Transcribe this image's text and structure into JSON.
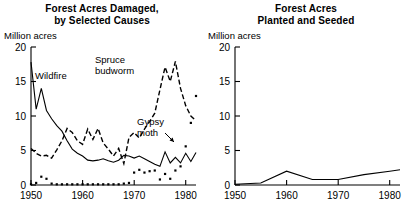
{
  "figure": {
    "unit_label_left": "Million acres",
    "unit_label_right": "Million acres"
  },
  "left": {
    "title_line1": "Forest Acres Damaged,",
    "title_line2": "by Selected Causes",
    "labels": {
      "wildfire": "Wildfire",
      "spruce_line1": "Spruce",
      "spruce_line2": "budworm",
      "gypsy_line1": "Gypsy",
      "gypsy_line2": "moth"
    },
    "y_ticks": [
      "0",
      "5",
      "10",
      "15",
      "20"
    ],
    "x_ticks": [
      "1950",
      "1960",
      "1970",
      "1980"
    ]
  },
  "right": {
    "title_line1": "Forest Acres",
    "title_line2": "Planted and Seeded",
    "y_ticks": [
      "0",
      "5",
      "10",
      "15",
      "20"
    ],
    "x_ticks": [
      "1950",
      "1960",
      "1970",
      "1980"
    ]
  },
  "chart_data": [
    {
      "type": "line",
      "title": "Forest Acres Damaged, by Selected Causes",
      "xlabel": "",
      "ylabel": "Million acres",
      "xlim": [
        1950,
        1982
      ],
      "ylim": [
        0,
        20
      ],
      "y_ticks": [
        0,
        5,
        10,
        15,
        20
      ],
      "x_ticks": [
        1950,
        1960,
        1970,
        1980
      ],
      "grid": false,
      "legend": "inline-annotations",
      "x": [
        1950,
        1951,
        1952,
        1953,
        1954,
        1955,
        1956,
        1957,
        1958,
        1959,
        1960,
        1961,
        1962,
        1963,
        1964,
        1965,
        1966,
        1967,
        1968,
        1969,
        1970,
        1971,
        1972,
        1973,
        1974,
        1975,
        1976,
        1977,
        1978,
        1979,
        1980,
        1981,
        1982
      ],
      "series": [
        {
          "name": "Wildfire",
          "style": "solid",
          "values": [
            17.8,
            11.0,
            14.0,
            10.8,
            9.6,
            8.6,
            7.8,
            6.4,
            5.2,
            4.6,
            4.2,
            3.6,
            3.5,
            3.6,
            3.8,
            3.5,
            3.3,
            3.6,
            4.3,
            4.2,
            3.9,
            4.2,
            3.8,
            3.4,
            3.0,
            2.7,
            4.8,
            3.2,
            4.0,
            3.2,
            4.6,
            3.4,
            4.7
          ]
        },
        {
          "name": "Spruce budworm",
          "style": "dashed",
          "values": [
            5.3,
            4.6,
            4.2,
            4.3,
            3.9,
            5.1,
            6.4,
            8.2,
            7.6,
            6.4,
            5.9,
            8.1,
            6.6,
            8.2,
            6.1,
            5.2,
            4.2,
            5.3,
            3.1,
            6.9,
            7.6,
            6.8,
            8.1,
            9.2,
            10.4,
            13.8,
            17.1,
            15.0,
            17.9,
            14.0,
            11.5,
            10.0,
            9.3
          ]
        },
        {
          "name": "Gypsy moth",
          "style": "dotted",
          "values": [
            0.1,
            0.3,
            1.2,
            0.9,
            0.2,
            0.1,
            0.1,
            0.1,
            0.1,
            0.1,
            0.1,
            0.1,
            0.1,
            0.1,
            0.1,
            0.1,
            0.1,
            0.1,
            0.2,
            0.3,
            1.8,
            2.2,
            1.8,
            2.0,
            2.1,
            0.8,
            1.6,
            0.9,
            2.1,
            2.7,
            5.6,
            9.0,
            12.9
          ]
        }
      ]
    },
    {
      "type": "line",
      "title": "Forest Acres Planted and Seeded",
      "xlabel": "",
      "ylabel": "Million acres",
      "xlim": [
        1950,
        1982
      ],
      "ylim": [
        0,
        20
      ],
      "y_ticks": [
        0,
        5,
        10,
        15,
        20
      ],
      "x_ticks": [
        1950,
        1960,
        1970,
        1980
      ],
      "grid": false,
      "x": [
        1950,
        1955,
        1960,
        1965,
        1970,
        1975,
        1980,
        1982
      ],
      "series": [
        {
          "name": "Planted and seeded",
          "style": "solid",
          "values": [
            0.1,
            0.3,
            2.0,
            0.8,
            0.8,
            1.5,
            2.0,
            2.2
          ]
        }
      ]
    }
  ]
}
